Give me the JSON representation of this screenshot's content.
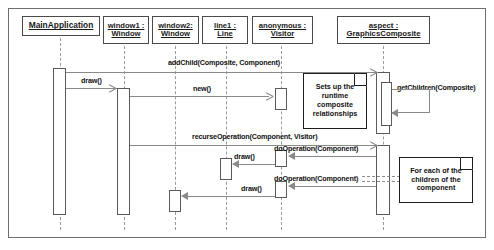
{
  "diagram": {
    "type": "uml-sequence-diagram",
    "title": "",
    "lifelines": [
      {
        "id": "main",
        "name": "MainApplication",
        "class": "",
        "x": 60,
        "head": {
          "left": 22,
          "top": 16,
          "width": 78,
          "height": 20
        },
        "activation": {
          "x": 53,
          "y": 68,
          "w": 13,
          "h": 147
        }
      },
      {
        "id": "window1",
        "name": "window1 :",
        "class": "Window",
        "x": 124,
        "head": {
          "left": 103,
          "top": 16,
          "width": 46,
          "height": 28
        },
        "activation": {
          "x": 117,
          "y": 88,
          "w": 13,
          "h": 127
        }
      },
      {
        "id": "window2",
        "name": "window2:",
        "class": "Window",
        "x": 175,
        "head": {
          "left": 152,
          "top": 16,
          "width": 47,
          "height": 28
        },
        "activation": null
      },
      {
        "id": "line1",
        "name": "line1 :",
        "class": "Line",
        "x": 226,
        "head": {
          "left": 202,
          "top": 16,
          "width": 46,
          "height": 28
        },
        "activation": null
      },
      {
        "id": "visitor",
        "name": "anonymous :",
        "class": "Visitor",
        "x": 281,
        "head": {
          "left": 252,
          "top": 16,
          "width": 61,
          "height": 28
        },
        "activation": null
      },
      {
        "id": "aspect",
        "name": "aspect :",
        "class": "GraphicsComposite",
        "x": 383,
        "head": {
          "left": 337,
          "top": 16,
          "width": 93,
          "height": 28
        },
        "activation": {
          "x": 376,
          "y": 72,
          "w": 14,
          "h": 62
        }
      }
    ],
    "activations": [
      {
        "owner": "visitor",
        "x": 274,
        "y": 88,
        "w": 13,
        "h": 22
      },
      {
        "owner": "aspect",
        "x": 376,
        "y": 145,
        "w": 14,
        "h": 70
      },
      {
        "owner": "line1",
        "x": 219,
        "y": 158,
        "w": 13,
        "h": 22
      },
      {
        "owner": "visitor",
        "x": 274,
        "y": 155,
        "w": 13,
        "h": 16
      },
      {
        "owner": "visitor",
        "x": 274,
        "y": 184,
        "w": 13,
        "h": 16
      },
      {
        "owner": "window2",
        "x": 169,
        "y": 170,
        "w": 13,
        "h": 22
      },
      {
        "owner": "line1",
        "x": 219,
        "y": 196,
        "w": 13,
        "h": 20
      }
    ],
    "messages": [
      {
        "id": "addChild",
        "label": "addChild(Composite, Component)",
        "from": "main",
        "to": "aspect",
        "y": 72,
        "dir": "right",
        "labelX": 168,
        "labelY": 60,
        "arrow": "open"
      },
      {
        "id": "draw1",
        "label": "draw()",
        "from": "main",
        "to": "window1",
        "y": 88,
        "dir": "right",
        "labelX": 80,
        "labelY": 76,
        "arrow": "open"
      },
      {
        "id": "new",
        "label": "new()",
        "from": "window1",
        "to": "visitor",
        "y": 96,
        "dir": "right",
        "labelX": 196,
        "labelY": 84,
        "arrow": "open"
      },
      {
        "id": "getChildren",
        "label": "getChildren(Composite)",
        "from": "aspect",
        "to": "aspect",
        "y": 104,
        "dir": "self",
        "labelX": 397,
        "labelY": 83,
        "arrow": "solid"
      },
      {
        "id": "recurseOperation",
        "label": "recurseOperation(Component, Visitor)",
        "from": "window1",
        "to": "aspect",
        "y": 145,
        "dir": "right",
        "labelX": 192,
        "labelY": 133,
        "arrow": "open"
      },
      {
        "id": "doOperation1",
        "label": "doOperation(Component)",
        "from": "aspect",
        "to": "visitor",
        "y": 156,
        "dir": "left",
        "labelX": 273,
        "labelY": 144,
        "arrow": "solid"
      },
      {
        "id": "draw2",
        "label": "draw()",
        "from": "visitor",
        "to": "line1",
        "y": 164,
        "dir": "left",
        "labelX": 233,
        "labelY": 152,
        "arrow": "solid"
      },
      {
        "id": "doOperation2",
        "label": "doOperation(Component)",
        "from": "aspect",
        "to": "visitor",
        "y": 186,
        "dir": "left",
        "labelX": 273,
        "labelY": 174,
        "arrow": "solid"
      },
      {
        "id": "draw3",
        "label": "draw()",
        "from": "visitor",
        "to": "window2",
        "y": 196,
        "dir": "left",
        "labelX": 240,
        "labelY": 184,
        "arrow": "solid"
      }
    ],
    "notes": [
      {
        "id": "note-runtime",
        "text": "Sets up the runtime composite relationships",
        "left": 303,
        "top": 73,
        "width": 64,
        "height": 55
      },
      {
        "id": "note-foreach",
        "text": "For each of the children of the component",
        "left": 399,
        "top": 157,
        "width": 74,
        "height": 46
      },
      {
        "id": "note-foreach-connector",
        "from_x": 362,
        "to_x": 399,
        "y": 179
      }
    ],
    "colors": {
      "frame_border": "#6e6e6e",
      "head_border": "#4a4a4a",
      "lifeline": "#9a9a9a",
      "message_line": "#8a8a8a",
      "note_border": "#1d1d1d",
      "text": "#111111",
      "background": "#ffffff"
    }
  }
}
